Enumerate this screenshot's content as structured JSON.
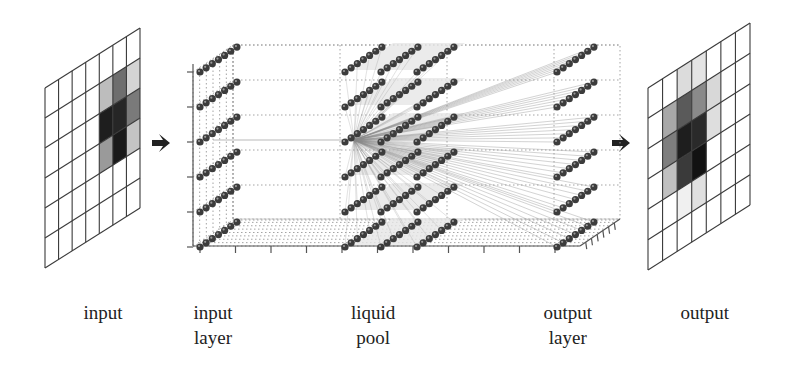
{
  "colors": {
    "grid_line": "#3a3a3a",
    "arrow": "#222222",
    "neuron": "#3c3c3c",
    "neuron_highlight": "#9a9a9a",
    "box_dotted": "#9a9a9a",
    "connection": "#8a8a8a",
    "plane_fill": "#e6e6e6",
    "axis": "#555555"
  },
  "labels": [
    {
      "id": "input",
      "lines": [
        "input"
      ],
      "x": 103,
      "y": 300
    },
    {
      "id": "input-layer",
      "lines": [
        "input",
        "layer"
      ],
      "x": 213,
      "y": 300
    },
    {
      "id": "liquid-pool",
      "lines": [
        "liquid",
        "pool"
      ],
      "x": 373,
      "y": 300
    },
    {
      "id": "output-layer",
      "lines": [
        "output",
        "layer"
      ],
      "x": 568,
      "y": 300
    },
    {
      "id": "output",
      "lines": [
        "output"
      ],
      "x": 705,
      "y": 300
    }
  ],
  "input_grid": {
    "cols": 7,
    "rows": 6,
    "x_left": 45,
    "x_right": 140,
    "y_left_top": 88,
    "y_right_top": 28,
    "height": 180,
    "shaded": [
      {
        "c": 4,
        "r": 1,
        "g": "#bdbdbd"
      },
      {
        "c": 5,
        "r": 1,
        "g": "#6e6e6e"
      },
      {
        "c": 6,
        "r": 1,
        "g": "#d4d4d4"
      },
      {
        "c": 4,
        "r": 2,
        "g": "#1e1e1e"
      },
      {
        "c": 5,
        "r": 2,
        "g": "#262626"
      },
      {
        "c": 6,
        "r": 2,
        "g": "#7a7a7a"
      },
      {
        "c": 4,
        "r": 3,
        "g": "#9a9a9a"
      },
      {
        "c": 5,
        "r": 3,
        "g": "#1a1a1a"
      },
      {
        "c": 6,
        "r": 3,
        "g": "#c4c4c4"
      }
    ]
  },
  "output_grid": {
    "cols": 7,
    "rows": 6,
    "x_left": 648,
    "x_right": 750,
    "y_left_top": 88,
    "y_right_top": 23,
    "height": 182,
    "shaded": [
      {
        "c": 2,
        "r": 0,
        "g": "#dcdcdc"
      },
      {
        "c": 3,
        "r": 0,
        "g": "#e4e4e4"
      },
      {
        "c": 1,
        "r": 1,
        "g": "#a8a8a8"
      },
      {
        "c": 2,
        "r": 1,
        "g": "#5a5a5a"
      },
      {
        "c": 3,
        "r": 1,
        "g": "#8a8a8a"
      },
      {
        "c": 4,
        "r": 1,
        "g": "#d8d8d8"
      },
      {
        "c": 1,
        "r": 2,
        "g": "#7e7e7e"
      },
      {
        "c": 2,
        "r": 2,
        "g": "#1e1e1e"
      },
      {
        "c": 3,
        "r": 2,
        "g": "#2a2a2a"
      },
      {
        "c": 4,
        "r": 2,
        "g": "#dedede"
      },
      {
        "c": 1,
        "r": 3,
        "g": "#c0c0c0"
      },
      {
        "c": 2,
        "r": 3,
        "g": "#3a3a3a"
      },
      {
        "c": 3,
        "r": 3,
        "g": "#121212"
      },
      {
        "c": 2,
        "r": 4,
        "g": "#f0f0f0"
      },
      {
        "c": 3,
        "r": 4,
        "g": "#e0e0e0"
      }
    ]
  },
  "arrows": [
    {
      "id": "arrow-input",
      "x": 152,
      "y": 143
    },
    {
      "id": "arrow-output",
      "x": 612,
      "y": 143
    }
  ],
  "network": {
    "box": {
      "x0": 193,
      "x1": 580,
      "y_back_top": 45,
      "front_top": 72,
      "front_bottom": 246,
      "depth_dx": 40,
      "depth_dy": -27
    },
    "row_ys": [
      72,
      107,
      142,
      177,
      212,
      247
    ],
    "neurons_per_row": 7,
    "layers": [
      {
        "id": "input-layer",
        "x_starts": [
          200
        ]
      },
      {
        "id": "liquid-pool",
        "x_starts": [
          345,
          381,
          417
        ]
      },
      {
        "id": "output-layer",
        "x_starts": [
          557
        ]
      }
    ],
    "hub": {
      "x": 354,
      "y": 140
    }
  }
}
